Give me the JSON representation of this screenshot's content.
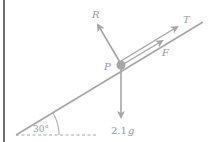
{
  "diagram": {
    "type": "inclined-plane-force-diagram",
    "incline_angle_label": "30°",
    "point_label": "P",
    "forces": [
      {
        "name": "normal-reaction",
        "label": "R"
      },
      {
        "name": "tension",
        "label": "T"
      },
      {
        "name": "friction",
        "label": "F"
      },
      {
        "name": "weight",
        "label_coef": "2.1",
        "label_unit": "g"
      }
    ],
    "colors": {
      "line": "#a6a6a6",
      "text": "#999999",
      "border": "#222222"
    }
  }
}
